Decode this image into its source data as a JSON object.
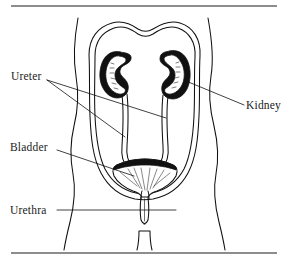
{
  "figure": {
    "background_color": "#ffffff",
    "ink_color": "#111111",
    "rule_color": "#8d8d8d"
  },
  "rules": {
    "top": "horizontal-rule-top",
    "bottom": "horizontal-rule-bottom"
  },
  "labels": {
    "ureter": "Ureter",
    "kidney": "Kidney",
    "bladder": "Bladder",
    "urethra": "Urethra"
  },
  "parts": {
    "body_outline": "body-contour",
    "abdominal_cavity": "abdominal-cavity-outline",
    "kidney_left": "left-kidney",
    "kidney_right": "right-kidney",
    "ureter_left": "left-ureter",
    "ureter_right": "right-ureter",
    "bladder": "urinary-bladder",
    "urethra": "urethra-tube",
    "perineum": "lower-body-structure"
  },
  "leader_lines": {
    "ureter_to_left": "leader-ureter-left",
    "ureter_to_right": "leader-ureter-right",
    "bladder": "leader-bladder",
    "kidney": "leader-kidney",
    "urethra": "leader-urethra"
  }
}
